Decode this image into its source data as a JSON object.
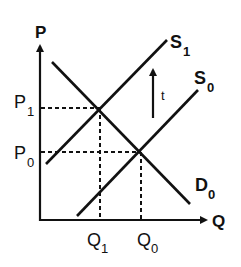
{
  "diagram": {
    "type": "supply-demand",
    "axes": {
      "y_label": "P",
      "x_label": "Q"
    },
    "curves": [
      {
        "id": "D0",
        "label": "D",
        "subscript": "0",
        "kind": "demand"
      },
      {
        "id": "S0",
        "label": "S",
        "subscript": "0",
        "kind": "supply"
      },
      {
        "id": "S1",
        "label": "S",
        "subscript": "1",
        "kind": "supply"
      }
    ],
    "price_ticks": [
      {
        "label": "P",
        "subscript": "1"
      },
      {
        "label": "P",
        "subscript": "0"
      }
    ],
    "quantity_ticks": [
      {
        "label": "Q",
        "subscript": "1"
      },
      {
        "label": "Q",
        "subscript": "0"
      }
    ],
    "shift_arrow": {
      "label": "t",
      "direction": "up"
    },
    "colors": {
      "ink": "#111111",
      "background": "#ffffff"
    }
  }
}
